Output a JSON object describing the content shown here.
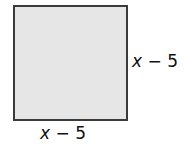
{
  "figure": {
    "shape": "square",
    "fill_color": "#e6e6e6",
    "border_color": "#3a3a3a",
    "side_right": {
      "variable": "x",
      "operator": "−",
      "constant": "5"
    },
    "side_bottom": {
      "variable": "x",
      "operator": "−",
      "constant": "5"
    }
  }
}
